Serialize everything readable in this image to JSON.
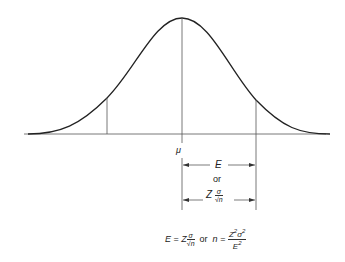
{
  "diagram": {
    "type": "normal-distribution-curve",
    "labels": {
      "mean": "μ",
      "error_symbol": "E",
      "or_word": "or",
      "z_symbol": "Z",
      "sigma": "σ",
      "sqrt_n": "√n",
      "n_symbol": "n",
      "formula_or": "or",
      "equals": "=",
      "z_sq": "Z",
      "sigma_sq": "σ",
      "e_sq": "E",
      "exp2": "2"
    },
    "formula_text": "E = Z σ/√n  or  n = Z²σ²/E²",
    "geometry": {
      "peak_x": 182,
      "peak_y": 18,
      "baseline_y": 134,
      "baseline_x_start": 25,
      "baseline_x_end": 325,
      "left_marker_x": 107,
      "right_marker_x": 256
    },
    "colors": {
      "line": "#333333",
      "background": "#ffffff"
    }
  }
}
